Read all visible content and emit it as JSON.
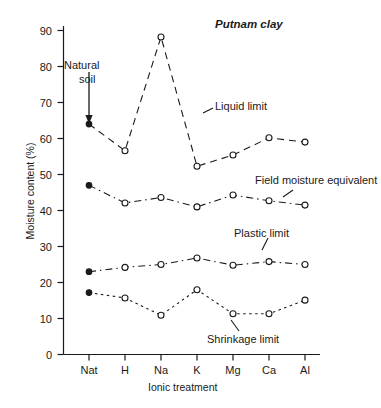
{
  "chart_data": {
    "type": "line",
    "title": "Putnam clay",
    "xlabel": "Ionic treatment",
    "ylabel": "Moisture content (%)",
    "categories": [
      "Nat",
      "H",
      "Na",
      "K",
      "Mg",
      "Ca",
      "Al"
    ],
    "ylim": [
      0,
      92
    ],
    "yticks": [
      0,
      10,
      20,
      30,
      40,
      50,
      60,
      70,
      80,
      90
    ],
    "ytick_labels": [
      "0",
      "10",
      "20",
      "30",
      "40",
      "50",
      "60",
      "70",
      "80",
      "90"
    ],
    "grid": false,
    "legend": "inline-annotations",
    "series": [
      {
        "name": "Liquid limit",
        "values": [
          64.0,
          56.6,
          88.2,
          52.3,
          55.4,
          60.2,
          59.0
        ],
        "marker": "circle-open",
        "first_point_marker": "circle-filled",
        "linestyle": "dashed"
      },
      {
        "name": "Field moisture equivalent",
        "values": [
          47.0,
          42.1,
          43.6,
          41.0,
          44.3,
          42.7,
          41.5
        ],
        "marker": "circle-open",
        "first_point_marker": "circle-filled",
        "linestyle": "dash-dot"
      },
      {
        "name": "Plastic limit",
        "values": [
          23.0,
          24.2,
          25.0,
          26.8,
          24.8,
          25.8,
          25.0
        ],
        "marker": "circle-open",
        "first_point_marker": "circle-filled",
        "linestyle": "dash-dot"
      },
      {
        "name": "Shrinkage limit",
        "values": [
          17.2,
          15.7,
          10.9,
          18.0,
          11.3,
          11.3,
          15.1
        ],
        "marker": "circle-open",
        "first_point_marker": "circle-filled",
        "linestyle": "dotted"
      }
    ],
    "annotations": [
      {
        "text": "Natural",
        "kind": "arrow-label-line1"
      },
      {
        "text": "soil",
        "kind": "arrow-label-line2"
      },
      {
        "text": "Liquid limit",
        "kind": "series-label"
      },
      {
        "text": "Field moisture equivalent",
        "kind": "series-label"
      },
      {
        "text": "Plastic limit",
        "kind": "series-label"
      },
      {
        "text": "Shrinkage limit",
        "kind": "series-label"
      }
    ],
    "colors": {
      "ink": "#1a1a1a",
      "background": "#ffffff"
    }
  },
  "labels": {
    "title": "Putnam clay",
    "ylabel": "Moisture content (%)",
    "xlabel": "Ionic treatment",
    "natural_soil_line1": "Natural",
    "natural_soil_line2": "soil",
    "liquid_limit": "Liquid limit",
    "field_moisture_equivalent": "Field moisture equivalent",
    "plastic_limit": "Plastic limit",
    "shrinkage_limit": "Shrinkage limit",
    "y0": "0",
    "y10": "10",
    "y20": "20",
    "y30": "30",
    "y40": "40",
    "y50": "50",
    "y60": "60",
    "y70": "70",
    "y80": "80",
    "y90": "90",
    "x0": "Nat",
    "x1": "H",
    "x2": "Na",
    "x3": "K",
    "x4": "Mg",
    "x5": "Ca",
    "x6": "Al"
  }
}
